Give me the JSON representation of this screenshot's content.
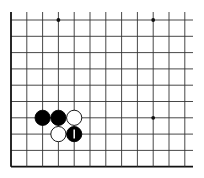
{
  "board": {
    "description": "Go board corner fragment (lower-left region, open to top and right)",
    "columns": 12,
    "rows": 10,
    "x_lines": [
      11,
      26.8,
      42.6,
      58.4,
      74.2,
      90,
      105.8,
      121.6,
      137.4,
      153.2,
      169,
      184.8
    ],
    "y_lines": [
      20,
      36.3,
      52.6,
      68.9,
      85.2,
      101.5,
      117.8,
      134.1,
      150.4,
      166.7
    ],
    "line_extend_right": 193,
    "colors": {
      "line": "#333333",
      "edge": "#111111",
      "black_stone": "#000000",
      "white_stone": "#ffffff",
      "mark": "#ffffff"
    },
    "star_points": [
      {
        "col": 3,
        "row": 0
      },
      {
        "col": 9,
        "row": 0
      },
      {
        "col": 9,
        "row": 6
      }
    ],
    "stones": [
      {
        "col": 2,
        "row": 6,
        "color": "black"
      },
      {
        "col": 3,
        "row": 6,
        "color": "black"
      },
      {
        "col": 4,
        "row": 6,
        "color": "white"
      },
      {
        "col": 3,
        "row": 7,
        "color": "white"
      },
      {
        "col": 4,
        "row": 7,
        "color": "black",
        "mark": "vertical-bar"
      }
    ]
  }
}
